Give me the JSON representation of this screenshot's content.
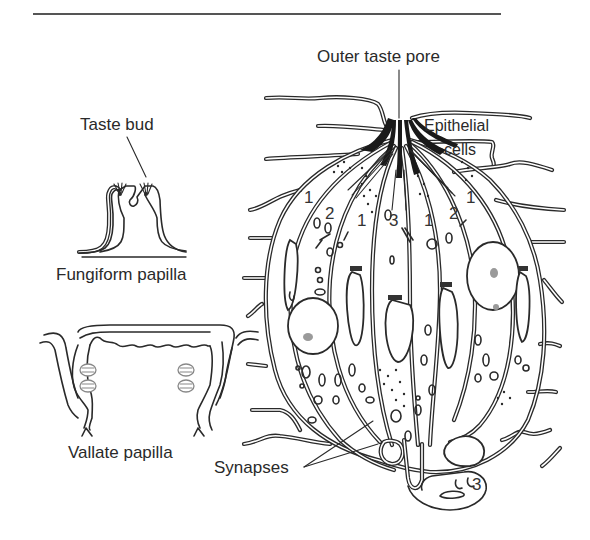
{
  "figure": {
    "labels": {
      "outer_taste_pore": "Outer taste pore",
      "epithelial_cells_line1": "Epithelial",
      "epithelial_cells_line2": "cells",
      "taste_bud": "Taste bud",
      "fungiform_papilla": "Fungiform papilla",
      "vallate_papilla": "Vallate papilla",
      "synapses": "Synapses"
    },
    "cell_type_markers": [
      {
        "id": "left-outer-1",
        "text": "1"
      },
      {
        "id": "left-2",
        "text": "2"
      },
      {
        "id": "left-inner-1",
        "text": "1"
      },
      {
        "id": "center-3",
        "text": "3"
      },
      {
        "id": "right-inner-1",
        "text": "1"
      },
      {
        "id": "right-2",
        "text": "2"
      },
      {
        "id": "right-outer-1",
        "text": "1"
      },
      {
        "id": "bottom-3",
        "text": "3"
      }
    ],
    "colors": {
      "line": "#2a2a2a",
      "nucleolus": "#9a9a9a",
      "background": "#ffffff"
    }
  }
}
